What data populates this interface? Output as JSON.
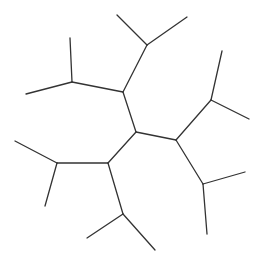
{
  "diagram": {
    "type": "skeletal-molecule",
    "stroke_color": "#333333",
    "background": "#ffffff",
    "bonds": [
      {
        "from": [
          117,
          15
        ],
        "to": [
          147,
          45
        ]
      },
      {
        "from": [
          187,
          17
        ],
        "to": [
          147,
          45
        ]
      },
      {
        "from": [
          147,
          45
        ],
        "to": [
          123,
          92
        ]
      },
      {
        "from": [
          123,
          92
        ],
        "to": [
          72,
          82
        ]
      },
      {
        "from": [
          72,
          82
        ],
        "to": [
          70,
          38
        ]
      },
      {
        "from": [
          72,
          82
        ],
        "to": [
          26,
          94
        ]
      },
      {
        "from": [
          123,
          92
        ],
        "to": [
          136,
          132
        ]
      },
      {
        "from": [
          136,
          132
        ],
        "to": [
          176,
          140
        ]
      },
      {
        "from": [
          176,
          140
        ],
        "to": [
          211,
          100
        ]
      },
      {
        "from": [
          211,
          100
        ],
        "to": [
          222,
          51
        ]
      },
      {
        "from": [
          211,
          100
        ],
        "to": [
          249,
          119
        ]
      },
      {
        "from": [
          176,
          140
        ],
        "to": [
          203,
          184
        ]
      },
      {
        "from": [
          203,
          184
        ],
        "to": [
          245,
          172
        ]
      },
      {
        "from": [
          203,
          184
        ],
        "to": [
          207,
          234
        ]
      },
      {
        "from": [
          136,
          132
        ],
        "to": [
          108,
          163
        ]
      },
      {
        "from": [
          108,
          163
        ],
        "to": [
          57,
          163
        ]
      },
      {
        "from": [
          57,
          163
        ],
        "to": [
          15,
          141
        ]
      },
      {
        "from": [
          57,
          163
        ],
        "to": [
          45,
          206
        ]
      },
      {
        "from": [
          108,
          163
        ],
        "to": [
          123,
          214
        ]
      },
      {
        "from": [
          123,
          214
        ],
        "to": [
          87,
          238
        ]
      },
      {
        "from": [
          123,
          214
        ],
        "to": [
          155,
          250
        ]
      }
    ]
  }
}
